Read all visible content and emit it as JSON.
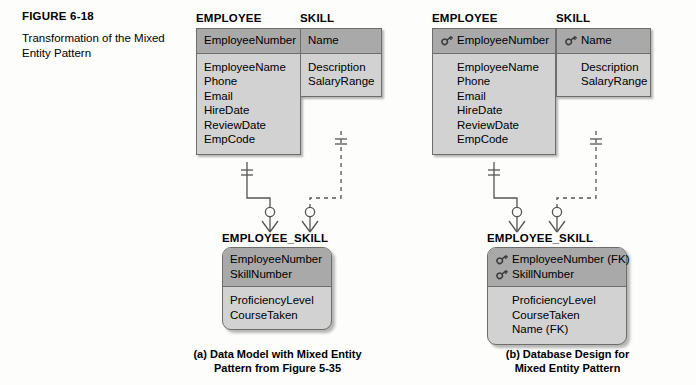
{
  "figure": {
    "number": "FIGURE 6-18",
    "title": "Transformation of the Mixed Entity Pattern"
  },
  "panels": [
    {
      "id": "a",
      "caption": "(a) Data Model with Mixed Entity\nPattern from Figure 5-35",
      "entities": [
        {
          "name": "EMPLOYEE",
          "key_attributes": [
            {
              "text": "EmployeeNumber",
              "key": false
            }
          ],
          "attributes": [
            {
              "text": "EmployeeName",
              "key": false
            },
            {
              "text": "Phone",
              "key": false
            },
            {
              "text": "Email",
              "key": false
            },
            {
              "text": "HireDate",
              "key": false
            },
            {
              "text": "ReviewDate",
              "key": false
            },
            {
              "text": "EmpCode",
              "key": false
            }
          ]
        },
        {
          "name": "SKILL",
          "key_attributes": [
            {
              "text": "Name",
              "key": false
            }
          ],
          "attributes": [
            {
              "text": "Description",
              "key": false
            },
            {
              "text": "SalaryRange",
              "key": false
            }
          ]
        },
        {
          "name": "EMPLOYEE_SKILL",
          "key_attributes": [
            {
              "text": "EmployeeNumber",
              "key": false
            },
            {
              "text": "SkillNumber",
              "key": false
            }
          ],
          "attributes": [
            {
              "text": "ProficiencyLevel",
              "key": false
            },
            {
              "text": "CourseTaken",
              "key": false
            }
          ]
        }
      ]
    },
    {
      "id": "b",
      "caption": "(b) Database Design for\nMixed Entity Pattern",
      "entities": [
        {
          "name": "EMPLOYEE",
          "key_attributes": [
            {
              "text": "EmployeeNumber",
              "key": true
            }
          ],
          "attributes": [
            {
              "text": "EmployeeName",
              "key": false
            },
            {
              "text": "Phone",
              "key": false
            },
            {
              "text": "Email",
              "key": false
            },
            {
              "text": "HireDate",
              "key": false
            },
            {
              "text": "ReviewDate",
              "key": false
            },
            {
              "text": "EmpCode",
              "key": false
            }
          ]
        },
        {
          "name": "SKILL",
          "key_attributes": [
            {
              "text": "Name",
              "key": true
            }
          ],
          "attributes": [
            {
              "text": "Description",
              "key": false
            },
            {
              "text": "SalaryRange",
              "key": false
            }
          ]
        },
        {
          "name": "EMPLOYEE_SKILL",
          "key_attributes": [
            {
              "text": "EmployeeNumber (FK)",
              "key": true
            },
            {
              "text": "SkillNumber",
              "key": true
            }
          ],
          "attributes": [
            {
              "text": "ProficiencyLevel",
              "key": false
            },
            {
              "text": "CourseTaken",
              "key": false
            },
            {
              "text": "Name (FK)",
              "key": false
            }
          ]
        }
      ]
    }
  ],
  "colors": {
    "header_fill": "#a9a9a9",
    "body_fill": "#d2d2d2",
    "border": "#6d6d6d",
    "line": "#555555",
    "background": "#fdfdfc"
  },
  "relationships": [
    {
      "from": "EMPLOYEE",
      "to": "EMPLOYEE_SKILL",
      "line": "solid",
      "parent_cardinality": "one-mandatory",
      "child_cardinality": "many-optional"
    },
    {
      "from": "SKILL",
      "to": "EMPLOYEE_SKILL",
      "line": "dashed",
      "parent_cardinality": "one-mandatory",
      "child_cardinality": "many-optional"
    }
  ]
}
